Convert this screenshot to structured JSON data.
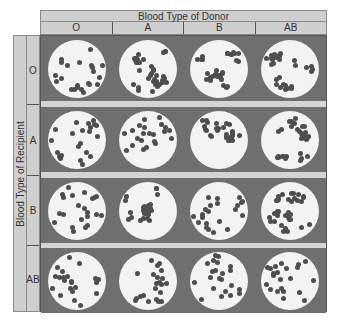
{
  "figure": {
    "column_header": "Blood Type of Donor",
    "row_header": "Blood Type of Recipient",
    "donor_types": [
      "O",
      "A",
      "B",
      "AB"
    ],
    "recipient_types": [
      "O",
      "A",
      "B",
      "AB"
    ],
    "colors": {
      "header_bg": "#cfcfcf",
      "cell_bg": "#6f6f6f",
      "plate": "#f3f3f1",
      "cell": "#4e4e4e",
      "separator": "#d4d4d4"
    },
    "agglutination": [
      [
        false,
        true,
        true,
        true
      ],
      [
        false,
        false,
        true,
        true
      ],
      [
        false,
        true,
        false,
        true
      ],
      [
        false,
        false,
        false,
        false
      ]
    ]
  }
}
